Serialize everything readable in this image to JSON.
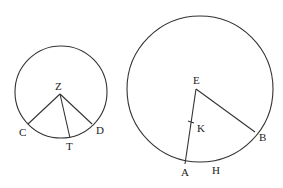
{
  "diagram": {
    "circle_left": {
      "center": [
        61,
        92
      ],
      "radius": 46,
      "center_label": "Z",
      "points": {
        "C": {
          "label": "C",
          "xy": [
            28,
            124
          ],
          "label_xy": [
            19,
            136
          ]
        },
        "T": {
          "label": "T",
          "xy": [
            70,
            138
          ],
          "label_xy": [
            66,
            150
          ]
        },
        "D": {
          "label": "D",
          "xy": [
            92,
            124
          ],
          "label_xy": [
            96,
            134
          ]
        }
      },
      "center_label_xy": [
        55,
        90
      ],
      "center_xy": [
        60,
        94
      ]
    },
    "circle_right": {
      "center": [
        200,
        89
      ],
      "radius": 73,
      "center_label": "E",
      "center_xy": [
        196,
        89
      ],
      "center_label_xy": [
        193,
        84
      ],
      "points": {
        "A": {
          "label": "A",
          "xy": [
            185,
            164
          ],
          "label_xy": [
            181,
            176
          ]
        },
        "B": {
          "label": "B",
          "xy": [
            255,
            132
          ],
          "label_xy": [
            259,
            141
          ]
        },
        "H": {
          "label": "H",
          "label_xy": [
            212,
            174
          ]
        },
        "K": {
          "label": "K",
          "xy": [
            191,
            122
          ],
          "label_xy": [
            197,
            132
          ]
        }
      }
    },
    "stroke_color": "#333333"
  }
}
